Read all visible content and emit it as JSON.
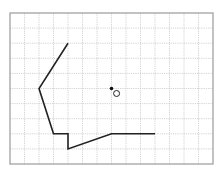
{
  "diagram": {
    "type": "grid-drawing",
    "grid": {
      "origin_px": [
        10,
        13
      ],
      "cols": 14,
      "rows": 10,
      "cell_w": 14.5,
      "cell_h": 15.1,
      "line_color": "#c8c8c8",
      "frame_color": "#9a9a9a"
    },
    "polyline": {
      "color": "#222222",
      "points_grid": [
        [
          4,
          2
        ],
        [
          2,
          5
        ],
        [
          3,
          8
        ],
        [
          4,
          8
        ],
        [
          4,
          9
        ],
        [
          7,
          8
        ],
        [
          10,
          8
        ]
      ]
    },
    "filled_dot": {
      "grid": [
        7,
        5
      ],
      "color": "#111111"
    },
    "hollow_circle": {
      "grid": [
        7.35,
        5.33
      ],
      "radius_px": 3,
      "color": "#222222"
    }
  }
}
